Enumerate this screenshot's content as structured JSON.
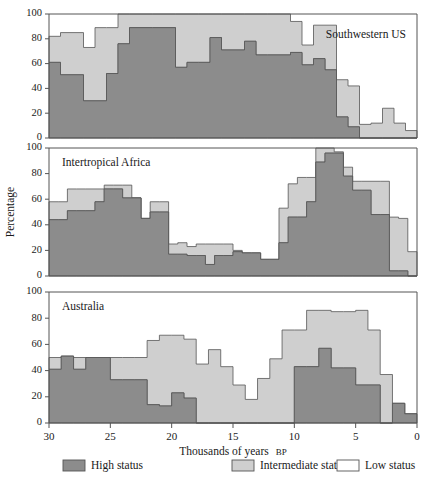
{
  "figure": {
    "width": 432,
    "height": 488,
    "background": "#ffffff"
  },
  "axis": {
    "xlabel_main": "Thousands of years",
    "xlabel_suffix": "BP",
    "ylabel": "Percentage",
    "xticks": [
      30,
      25,
      20,
      15,
      10,
      5,
      0
    ],
    "yticks": [
      0,
      20,
      40,
      60,
      80,
      100
    ],
    "xlim": [
      30,
      0
    ],
    "ylim": [
      0,
      100
    ],
    "x_reversed": true,
    "grid": false
  },
  "colors": {
    "high_status": "#8c8c8c",
    "intermediate_status": "#cfcfcf",
    "low_status": "#ffffff",
    "outline": "#555555",
    "text": "#1a1a1a"
  },
  "legend": {
    "position": "bottom",
    "items": [
      {
        "label": "High status",
        "color": "#8c8c8c",
        "key": "high"
      },
      {
        "label": "Intermediate status",
        "color": "#cfcfcf",
        "key": "intermediate"
      },
      {
        "label": "Low status",
        "color": "#ffffff",
        "key": "low"
      }
    ]
  },
  "chart_data": {
    "type": "area",
    "title": "",
    "subtitle": "",
    "xlabel": "Thousands of years BP",
    "ylabel": "Percentage",
    "xlim": [
      30,
      0
    ],
    "ylim": [
      0,
      100
    ],
    "grid": false,
    "legend_position": "bottom",
    "stacked": true,
    "bin_width": 1,
    "x_bin_starts": [
      30,
      29,
      28,
      27,
      26,
      25,
      24,
      23,
      22,
      21,
      20,
      19,
      18,
      17,
      16,
      15,
      14,
      13,
      12,
      11,
      10,
      9,
      8,
      7,
      6,
      5,
      4,
      3,
      2,
      1
    ],
    "panels": [
      {
        "name": "Southwestern US",
        "title": "Southwestern US",
        "title_align": "right",
        "series": [
          {
            "name": "High status",
            "key": "high",
            "color": "#8c8c8c",
            "values": [
              61,
              51,
              51,
              30,
              30,
              52,
              76,
              89,
              89,
              89,
              89,
              57,
              61,
              61,
              81,
              71,
              71,
              78,
              67,
              67,
              67,
              69,
              59,
              64,
              55,
              17,
              9,
              0,
              0,
              0
            ]
          },
          {
            "name": "Intermediate status",
            "key": "intermediate",
            "color": "#cfcfcf",
            "values": [
              21,
              34,
              34,
              43,
              59,
              37,
              24,
              11,
              11,
              11,
              11,
              43,
              39,
              39,
              19,
              29,
              29,
              22,
              33,
              33,
              33,
              25,
              16,
              27,
              36,
              30,
              33,
              11,
              12,
              24,
              12,
              6
            ]
          },
          {
            "name": "Low status",
            "key": "low",
            "color": "#ffffff",
            "values": [
              18,
              15,
              15,
              27,
              11,
              11,
              0,
              0,
              0,
              0,
              0,
              0,
              0,
              0,
              0,
              0,
              0,
              0,
              0,
              0,
              0,
              6,
              25,
              9,
              9,
              53,
              58,
              89,
              88,
              76,
              88,
              94
            ]
          }
        ],
        "totals_visible": [
          82,
          85,
          85,
          73,
          89,
          89,
          100,
          100,
          100,
          100,
          100,
          100,
          100,
          100,
          100,
          100,
          100,
          100,
          100,
          100,
          100,
          94,
          75,
          91,
          91,
          47,
          42,
          11,
          12,
          24,
          12,
          6
        ]
      },
      {
        "name": "Intertropical Africa",
        "title": "Intertropical Africa",
        "title_align": "left",
        "series": [
          {
            "name": "High status",
            "key": "high",
            "color": "#8c8c8c",
            "values": [
              44,
              44,
              51,
              51,
              51,
              58,
              68,
              68,
              61,
              61,
              45,
              50,
              50,
              17,
              17,
              16,
              16,
              9,
              16,
              16,
              19,
              18,
              18,
              13,
              13,
              26,
              46,
              46,
              58,
              89,
              96,
              96,
              78,
              67,
              67,
              48,
              48,
              4,
              4,
              0
            ]
          },
          {
            "name": "Intermediate status",
            "key": "intermediate",
            "color": "#cfcfcf",
            "values": [
              14,
              14,
              17,
              17,
              17,
              10,
              3,
              3,
              10,
              0,
              0,
              8,
              8,
              8,
              9,
              7,
              9,
              16,
              9,
              9,
              1,
              0,
              0,
              0,
              0,
              27,
              26,
              31,
              19,
              11,
              4,
              1,
              7,
              7,
              7,
              26,
              26,
              42,
              41,
              19
            ]
          },
          {
            "name": "Low status",
            "key": "low",
            "color": "#ffffff",
            "values": [
              42,
              42,
              32,
              32,
              32,
              32,
              29,
              29,
              29,
              39,
              55,
              42,
              42,
              75,
              74,
              77,
              75,
              75,
              75,
              75,
              80,
              82,
              82,
              87,
              87,
              47,
              28,
              23,
              23,
              0,
              0,
              3,
              15,
              26,
              26,
              26,
              26,
              54,
              55,
              81
            ]
          }
        ],
        "totals_visible": [
          58,
          58,
          68,
          68,
          68,
          68,
          71,
          71,
          71,
          61,
          45,
          58,
          58,
          25,
          26,
          23,
          25,
          25,
          25,
          25,
          20,
          18,
          18,
          13,
          13,
          53,
          72,
          77,
          77,
          100,
          100,
          97,
          85,
          74,
          74,
          74,
          74,
          46,
          45,
          19
        ]
      },
      {
        "name": "Australia",
        "title": "Australia",
        "title_align": "left",
        "series": [
          {
            "name": "High status",
            "key": "high",
            "color": "#8c8c8c",
            "values": [
              41,
              51,
              41,
              50,
              50,
              33,
              33,
              33,
              14,
              13,
              23,
              19,
              0,
              0,
              0,
              0,
              0,
              0,
              0,
              0,
              43,
              43,
              57,
              42,
              42,
              29,
              29,
              0,
              15,
              7
            ]
          },
          {
            "name": "Intermediate status",
            "key": "intermediate",
            "color": "#cfcfcf",
            "values": [
              9,
              0,
              9,
              0,
              0,
              17,
              17,
              17,
              49,
              54,
              44,
              45,
              45,
              56,
              43,
              29,
              18,
              34,
              49,
              71,
              28,
              43,
              29,
              43,
              43,
              57,
              42,
              37,
              0,
              0
            ]
          },
          {
            "name": "Low status",
            "key": "low",
            "color": "#ffffff",
            "values": [
              50,
              49,
              50,
              50,
              50,
              50,
              50,
              50,
              37,
              33,
              33,
              36,
              55,
              44,
              57,
              71,
              82,
              66,
              51,
              29,
              29,
              14,
              14,
              15,
              15,
              14,
              29,
              63,
              85,
              93
            ]
          }
        ],
        "totals_visible": [
          50,
          51,
          50,
          50,
          50,
          50,
          50,
          50,
          63,
          67,
          67,
          64,
          45,
          56,
          43,
          29,
          18,
          34,
          49,
          71,
          71,
          86,
          86,
          85,
          85,
          86,
          71,
          37,
          15,
          7
        ]
      }
    ]
  },
  "panel_geometry": {
    "plot_left": 49,
    "plot_right": 417,
    "panels": [
      {
        "top": 14,
        "bottom": 138
      },
      {
        "top": 148,
        "bottom": 276
      },
      {
        "top": 292,
        "bottom": 423
      }
    ]
  }
}
